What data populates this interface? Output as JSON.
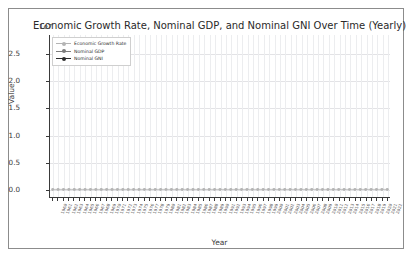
{
  "figure": {
    "background": "#ffffff",
    "border_color": "#8c8c8c"
  },
  "title": "Economic Growth Rate, Nominal GDP, and Nominal GNI Over Time (Yearly)",
  "axes": {
    "ylabel": "Value",
    "xlabel": "Year",
    "y_offset_text": "1e7",
    "y_ticks": [
      "0.0",
      "0.5",
      "1.0",
      "1.5",
      "2.0",
      "2.5"
    ],
    "y_tick_values": [
      0,
      5000000,
      10000000,
      15000000,
      20000000,
      25000000
    ],
    "ylim": [
      -1500000,
      28500000
    ],
    "grid": true
  },
  "legend": {
    "position": "upper left",
    "entries": [
      {
        "label": "Economic Growth Rate",
        "color": "#b4b4b4",
        "marker": "circle"
      },
      {
        "label": "Nominal GDP",
        "color": "#7d7d7d",
        "marker": "circle"
      },
      {
        "label": "Nominal GNI",
        "color": "#2e2e2e",
        "marker": "circle"
      }
    ]
  },
  "chart_data": {
    "type": "line",
    "title": "Economic Growth Rate, Nominal GDP, and Nominal GNI Over Time (Yearly)",
    "xlabel": "Year",
    "ylabel": "Value",
    "y_offset": "1e7",
    "ylim": [
      -1500000,
      28500000
    ],
    "grid": true,
    "legend_position": "upper left",
    "categories": [
      "1960",
      "1961",
      "1962",
      "1963",
      "1964",
      "1965",
      "1966",
      "1967",
      "1968",
      "1969",
      "1970",
      "1971",
      "1972",
      "1973",
      "1974",
      "1975",
      "1976",
      "1977",
      "1978",
      "1979",
      "1980",
      "1981",
      "1982",
      "1983",
      "1984",
      "1985",
      "1986",
      "1987",
      "1988",
      "1989",
      "1990",
      "1991",
      "1992",
      "1993",
      "1994",
      "1995",
      "1996",
      "1997",
      "1998",
      "1999",
      "2000",
      "2001",
      "2002",
      "2003",
      "2004",
      "2005",
      "2006",
      "2007",
      "2008",
      "2009",
      "2010",
      "2011",
      "2012",
      "2013",
      "2014",
      "2015",
      "2016",
      "2017",
      "2018",
      "2019",
      "2020",
      "2021",
      "2022"
    ],
    "series": [
      {
        "name": "Economic Growth Rate",
        "color": "#b4b4b4",
        "values": [
          2.5,
          4.2,
          5.1,
          4.4,
          5.8,
          6.4,
          6.6,
          2.7,
          4.9,
          3.1,
          0.2,
          3.3,
          5.3,
          5.6,
          -0.5,
          -0.2,
          5.4,
          4.6,
          5.6,
          3.2,
          -0.3,
          2.5,
          -1.8,
          4.6,
          7.2,
          4.2,
          3.5,
          3.5,
          4.2,
          3.7,
          1.9,
          -0.1,
          3.5,
          2.8,
          4.0,
          2.7,
          3.8,
          4.4,
          4.5,
          4.8,
          4.1,
          1.0,
          1.7,
          2.8,
          3.9,
          3.5,
          2.8,
          2.0,
          0.1,
          -2.6,
          2.7,
          1.6,
          2.3,
          2.1,
          2.5,
          2.9,
          1.8,
          2.5,
          3.0,
          2.3,
          -2.8,
          5.9,
          2.1
        ]
      },
      {
        "name": "Nominal GDP",
        "color": "#7d7d7d",
        "values": [
          543300000,
          563300000,
          605100000,
          638600000,
          685800000,
          743700000,
          815000000,
          861700000,
          942500000,
          1019900000,
          1073300000,
          1164850000,
          1279110000,
          1425380000,
          1545240000,
          1684900000,
          1873410000,
          2081830000,
          2351600000,
          2627330000,
          2857310000,
          3207040000,
          3343790000,
          3634040000,
          4037610000,
          4339000000,
          4579630000,
          4855220000,
          5236440000,
          5641580000,
          5963140000,
          6158130000,
          6520330000,
          6858550000,
          7287240000,
          7639750000,
          8073120000,
          8577550000,
          9062820000,
          9630660000,
          10250950000,
          10581930000,
          10929110000,
          11456450000,
          12217190000,
          13039200000,
          13815590000,
          14474230000,
          14769860000,
          14478070000,
          15048970000,
          15599730000,
          16253970000,
          16843190000,
          17550680000,
          18206020000,
          18695110000,
          19479620000,
          20527160000,
          21372580000,
          21060470000,
          23315080000,
          25462700000
        ],
        "note_units": "values shown are scaled to the 1e7 axis in the plot"
      },
      {
        "name": "Nominal GNI",
        "color": "#2e2e2e",
        "values": [
          547400000,
          567800000,
          610000000,
          643500000,
          691100000,
          749600000,
          821200000,
          868200000,
          949600000,
          1027000000,
          1081000000,
          1173000000,
          1288000000,
          1437000000,
          1559000000,
          1700000000,
          1889000000,
          2098000000,
          2370000000,
          2650000000,
          2883000000,
          3235000000,
          3372000000,
          3664000000,
          4070000000,
          4372000000,
          4612000000,
          4889000000,
          5272000000,
          5677000000,
          5999000000,
          6196000000,
          6559000000,
          6898000000,
          7329000000,
          7684000000,
          8119000000,
          8625000000,
          9113000000,
          9683000000,
          10307000000,
          10640000000,
          10989000000,
          11519000000,
          12285000000,
          13112000000,
          13893000000,
          14555000000,
          14853000000,
          14559000000,
          15135000000,
          15691000000,
          16349000000,
          16942000000,
          17654000000,
          18313000000,
          18805000000,
          19594000000,
          20648000000,
          21500000000,
          21186000000,
          23452000000,
          26200000000
        ],
        "note_units": "values shown are scaled to the 1e7 axis in the plot"
      }
    ]
  }
}
